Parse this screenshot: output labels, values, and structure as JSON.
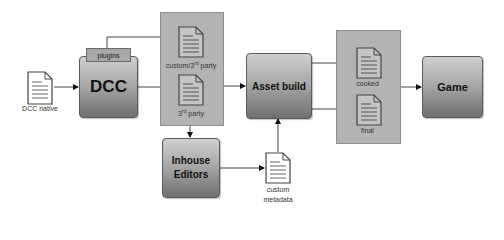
{
  "diagram": {
    "nodes": {
      "dcc_native": {
        "label": "DCC native",
        "type": "document"
      },
      "dcc": {
        "label": "DCC",
        "type": "process",
        "tab": "plugins"
      },
      "custom_3rd_party": {
        "label_main": "custom/3",
        "label_sup": "rd",
        "label_tail": " party",
        "type": "document"
      },
      "third_party": {
        "label_main": "3",
        "label_sup": "rd",
        "label_tail": " party",
        "type": "document"
      },
      "inhouse_editors": {
        "label_line1": "Inhouse",
        "label_line2": "Editors",
        "type": "process"
      },
      "custom_metadata": {
        "label_line1": "custom",
        "label_line2": "metadata",
        "type": "document"
      },
      "asset_build": {
        "label": "Asset build",
        "type": "process"
      },
      "cooked": {
        "label": "cooked",
        "type": "document"
      },
      "final": {
        "label": "final",
        "type": "document"
      },
      "game": {
        "label": "Game",
        "type": "process"
      }
    },
    "edges": [
      {
        "from": "dcc_native",
        "to": "dcc"
      },
      {
        "from": "dcc.plugins",
        "to": "custom_3rd_party"
      },
      {
        "from": "dcc",
        "to": "third_party"
      },
      {
        "from": "source_panel",
        "to": "inhouse_editors"
      },
      {
        "from": "source_panel",
        "to": "asset_build"
      },
      {
        "from": "inhouse_editors",
        "to": "custom_metadata"
      },
      {
        "from": "custom_metadata",
        "to": "asset_build"
      },
      {
        "from": "asset_build",
        "to": "cooked"
      },
      {
        "from": "asset_build",
        "to": "final"
      },
      {
        "from": "output_panel",
        "to": "game"
      }
    ],
    "colors": {
      "panel": "#b3b3b3",
      "box_top": "#cfcfcf",
      "box_bottom": "#6f6f6f",
      "line": "#333333"
    }
  }
}
